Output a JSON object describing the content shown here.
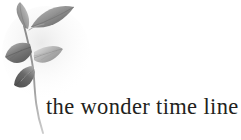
{
  "image": {
    "kind": "logo-artwork",
    "width": 241,
    "height": 140,
    "background_color": "#ffffff"
  },
  "wordmark": {
    "text": "the wonder time line",
    "color": "#231f20",
    "style": "serif lowercase"
  },
  "mark": {
    "subject": "botanical branch with five leaves",
    "technique": "grayscale watercolor wash",
    "palette": {
      "darkest": "#4a4a4a",
      "dark": "#6b6b6b",
      "mid": "#8f8f8f",
      "light": "#b5b5b5",
      "lightest": "#d8d8d8",
      "stem": "#9a9a9a"
    },
    "leaves": [
      {
        "name": "upper-right-leaf",
        "tone": "#7d7d7d"
      },
      {
        "name": "upper-left-leaf",
        "tone": "#8a8a8a"
      },
      {
        "name": "mid-left-leaf",
        "tone": "#6f6f6f"
      },
      {
        "name": "mid-right-leaf",
        "tone": "#949494"
      },
      {
        "name": "lower-left-leaf",
        "tone": "#5f5f5f"
      }
    ],
    "stem": {
      "name": "curving-stem",
      "description": "thin stem rising through leaves then curving down past the wordmark baseline"
    }
  }
}
